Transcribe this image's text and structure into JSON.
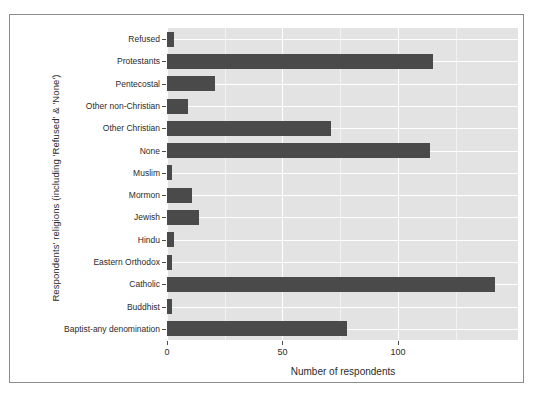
{
  "chart_data": {
    "type": "bar",
    "orientation": "horizontal",
    "title": "",
    "xlabel": "Number of respondents",
    "ylabel": "Respondents' religions (including 'Refused' & 'None')",
    "categories": [
      "Refused",
      "Protestants",
      "Pentecostal",
      "Other non-Christian",
      "Other Christian",
      "None",
      "Muslim",
      "Mormon",
      "Jewish",
      "Hindu",
      "Eastern Orthodox",
      "Catholic",
      "Buddhist",
      "Baptist-any denomination"
    ],
    "values": [
      3,
      115,
      21,
      9,
      71,
      114,
      2,
      11,
      14,
      3,
      2,
      142,
      2,
      78
    ],
    "xlim": [
      0,
      152
    ],
    "xticks": [
      0,
      50,
      100
    ],
    "xtick_labels": [
      "0",
      "50",
      "100"
    ],
    "x_minor_ticks": [
      25,
      75,
      125
    ],
    "grid": true,
    "legend": null,
    "colors": {
      "bar": "#4a4a4a",
      "panel": "#e3e3e3",
      "major_gridline": "#ffffff",
      "minor_gridline": "#f2f2f2",
      "text": "#2b2b2b",
      "frame": "#8c8c8c",
      "background": "#ffffff"
    }
  }
}
